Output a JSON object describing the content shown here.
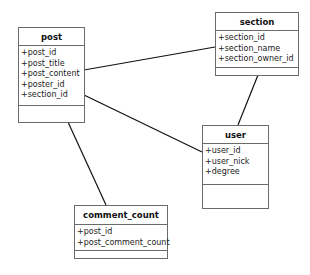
{
  "diagram": {
    "type": "uml-class-diagram",
    "classes": [
      {
        "id": "post",
        "name": "post",
        "attributes": [
          "+post_id",
          "+post_title",
          "+post_content",
          "+poster_id",
          "+section_id"
        ],
        "operations": []
      },
      {
        "id": "section",
        "name": "section",
        "attributes": [
          "+section_id",
          "+section_name",
          "+section_owner_id"
        ],
        "operations": []
      },
      {
        "id": "user",
        "name": "user",
        "attributes": [
          "+user_id",
          "+user_nick",
          "+degree"
        ],
        "operations": []
      },
      {
        "id": "comment_count",
        "name": "comment_count",
        "attributes": [
          "+post_id",
          "+post_comment_count"
        ],
        "operations": []
      }
    ],
    "associations": [
      {
        "from": "post",
        "to": "section"
      },
      {
        "from": "post",
        "to": "user"
      },
      {
        "from": "post",
        "to": "comment_count"
      },
      {
        "from": "section",
        "to": "user"
      }
    ],
    "colors": {
      "border": "#6b6b6b",
      "line": "#111111",
      "background": "#ffffff"
    }
  }
}
